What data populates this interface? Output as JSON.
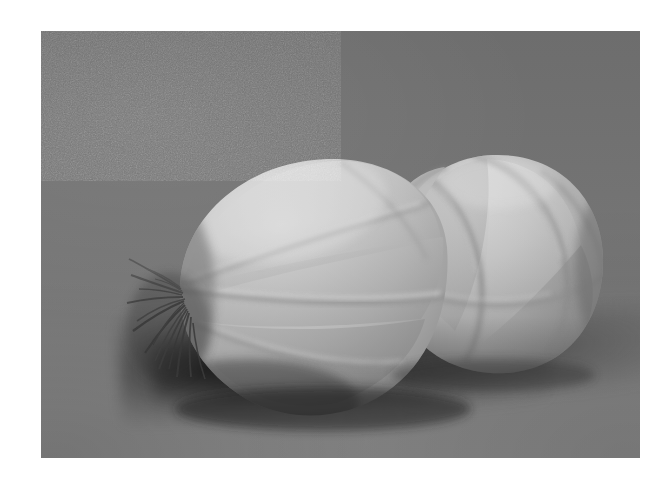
{
  "page": {
    "kind": "photograph",
    "width": 666,
    "height": 487,
    "background": "#ffffff",
    "caption": ""
  },
  "photo": {
    "x": 41,
    "y": 31,
    "width": 599,
    "height": 427,
    "subject": "double onion",
    "subject_description": "A twin (double-bulbed) onion resting on a flat surface, photographed in black and white against a plain gray backdrop.",
    "palette": {
      "paper": "#ffffff",
      "backdrop_top": "#6d6d6d",
      "backdrop_bottom": "#848484",
      "table": "#828282",
      "onion_highlight": "#d6d6d6",
      "onion_midtone": "#b6b6b6",
      "onion_shadow": "#8a8a8a",
      "segment_line": "#9a9a9a",
      "cast_shadow": "#2f2f2f",
      "root_fibers": "#4a4a4a"
    },
    "monochrome": true,
    "grain": "heavy film grain"
  },
  "onion": {
    "label": "double-onion",
    "bulbs": [
      {
        "name": "left-bulb",
        "cx": 268,
        "cy": 246,
        "rx": 136,
        "ry": 120,
        "rotation_deg": -12,
        "segments": 4
      },
      {
        "name": "right-bulb",
        "cx": 452,
        "cy": 230,
        "rx": 106,
        "ry": 106,
        "rotation_deg": -8,
        "segments": 5
      }
    ],
    "roots": {
      "name": "root-tuft",
      "x": 74,
      "y": 212,
      "width": 74,
      "height": 122,
      "strand_count": 16
    },
    "neck": {
      "name": "neck-junction",
      "x": 366,
      "y": 150
    }
  }
}
